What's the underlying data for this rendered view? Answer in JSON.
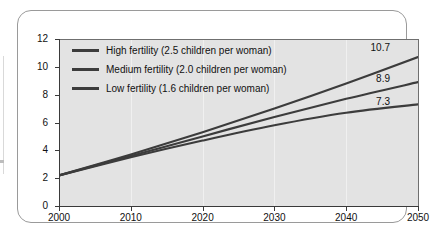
{
  "chart_data": {
    "type": "line",
    "title": "",
    "subtitle": "",
    "xlabel": "",
    "ylabel": "",
    "xlim": [
      2000,
      2050
    ],
    "ylim": [
      0,
      12
    ],
    "x_ticks": [
      "2000",
      "2010",
      "2020",
      "2030",
      "2040",
      "2050"
    ],
    "y_ticks": [
      "0",
      "2",
      "4",
      "6",
      "8",
      "10",
      "12"
    ],
    "grid": "vertical-only",
    "legend_position": "inside-top-left",
    "x": [
      2000,
      2010,
      2020,
      2030,
      2040,
      2050
    ],
    "series": [
      {
        "name": "High fertility (2.5 children per woman)",
        "short_name": "High fertility",
        "fertility_rate": "2.5",
        "values": [
          2.2,
          3.7,
          5.3,
          7.0,
          8.8,
          10.7
        ],
        "end_label": "10.7",
        "color": "#3c3c3c"
      },
      {
        "name": "Medium fertility (2.0 children per woman)",
        "short_name": "Medium fertility",
        "fertility_rate": "2.0",
        "values": [
          2.2,
          3.6,
          5.0,
          6.4,
          7.7,
          8.9
        ],
        "end_label": "8.9",
        "color": "#3c3c3c"
      },
      {
        "name": "Low fertility (1.6 children per woman)",
        "short_name": "Low fertility",
        "fertility_rate": "1.6",
        "values": [
          2.2,
          3.5,
          4.7,
          5.8,
          6.7,
          7.3
        ],
        "end_label": "7.3",
        "color": "#3c3c3c"
      }
    ]
  },
  "legend": {
    "items": [
      {
        "label": "High fertility (2.5 children per woman)"
      },
      {
        "label": "Medium fertility (2.0 children per woman)"
      },
      {
        "label": "Low fertility (1.6 children per woman)"
      }
    ]
  },
  "end_labels": {
    "high": "10.7",
    "medium": "8.9",
    "low": "7.3"
  },
  "axes": {
    "y_ticks": [
      "12",
      "10",
      "8",
      "6",
      "4",
      "2",
      "0"
    ],
    "x_ticks": [
      "2000",
      "2010",
      "2020",
      "2030",
      "2040",
      "2050"
    ]
  },
  "colors": {
    "plot_background": "#e3e3e3",
    "panel_background": "#ffffff",
    "line": "#3c3c3c",
    "axis": "#3a3a3a",
    "gridline": "#f2f2f2"
  }
}
